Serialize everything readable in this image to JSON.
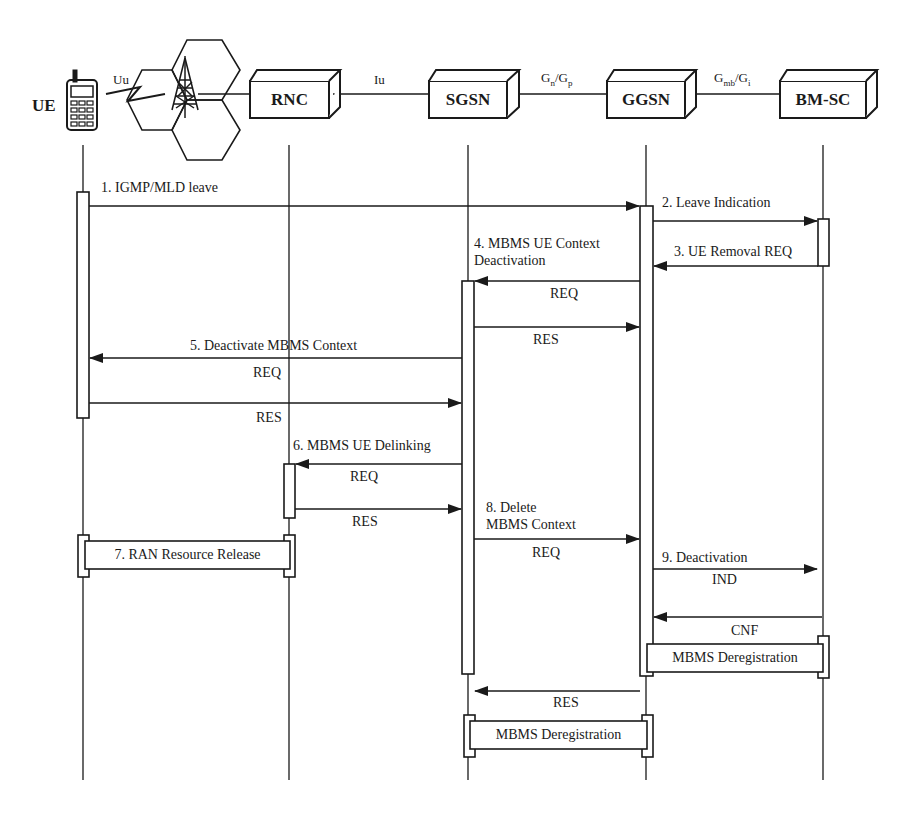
{
  "diagram": {
    "type": "sequence-diagram"
  },
  "nodes": {
    "ue": {
      "label": "UE",
      "x": 83
    },
    "rnc": {
      "label": "RNC",
      "x": 289
    },
    "sgsn": {
      "label": "SGSN",
      "x": 468
    },
    "ggsn": {
      "label": "GGSN",
      "x": 646
    },
    "bmsc": {
      "label": "BM-SC",
      "x": 823
    }
  },
  "interfaces": {
    "uu": "Uu",
    "iu": "Iu",
    "gn_gp": {
      "g1": "G",
      "s1": "n",
      "sep": "/G",
      "s2": "p"
    },
    "gmb_gi": {
      "g1": "G",
      "s1": "mb",
      "sep": "/G",
      "s2": "i"
    }
  },
  "messages": {
    "m1": {
      "label": "1. IGMP/MLD leave",
      "from": "UE",
      "to": "GGSN"
    },
    "m2": {
      "label": "2. Leave Indication",
      "from": "GGSN",
      "to": "BM-SC"
    },
    "m3": {
      "label": "3. UE Removal REQ",
      "from": "BM-SC",
      "to": "GGSN"
    },
    "m4_title1": "4. MBMS UE Context",
    "m4_title2": "Deactivation",
    "m4_req": "REQ",
    "m4_res": "RES",
    "m5_title": "5. Deactivate MBMS Context",
    "m5_req": "REQ",
    "m5_res": "RES",
    "m6_title": "6. MBMS UE Delinking",
    "m6_req": "REQ",
    "m6_res": "RES",
    "m7_box": "7. RAN Resource Release",
    "m8_title1": "8. Delete",
    "m8_title2": "MBMS Context",
    "m8_req": "REQ",
    "m9_title": "9. Deactivation",
    "m9_ind": "IND",
    "m9_cnf": "CNF",
    "bmsc_dereg": "MBMS Deregistration",
    "m4_final_res": "RES",
    "sgsn_dereg": "MBMS Deregistration"
  },
  "icons": {
    "ue": "mobile-phone-icon",
    "cell": "hexagon-cell-icon",
    "tower": "antenna-tower-icon",
    "radio": "lightning-radio-link-icon"
  },
  "colors": {
    "ink": "#1a1a1a",
    "background": "#ffffff"
  }
}
